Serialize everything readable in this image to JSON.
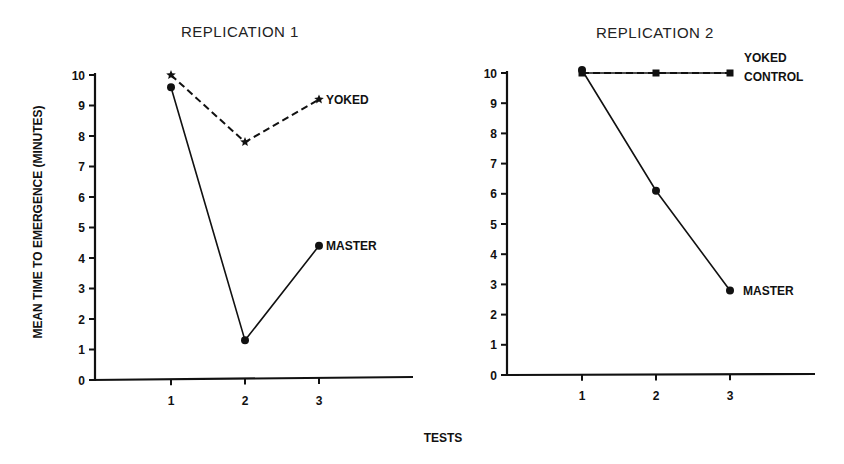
{
  "figure": {
    "shared_xlabel": "TESTS",
    "shared_ylabel": "MEAN TIME TO EMERGENCE (MINUTES)"
  },
  "chart_data": [
    {
      "type": "line",
      "title": "REPLICATION 1",
      "xlabel": "TESTS",
      "ylabel": "MEAN TIME TO EMERGENCE (MINUTES)",
      "x": [
        1,
        2,
        3
      ],
      "x_tick_labels": [
        "1",
        "2",
        "3"
      ],
      "y_ticks": [
        0,
        1,
        2,
        3,
        4,
        5,
        6,
        7,
        8,
        9,
        10
      ],
      "ylim": [
        0,
        10
      ],
      "grid": false,
      "legend": "inline labels at end of lines",
      "series": [
        {
          "name": "YOKED",
          "label": "YOKED",
          "style": "dashed",
          "marker": "star",
          "values": [
            10.0,
            7.8,
            9.2
          ]
        },
        {
          "name": "MASTER",
          "label": "MASTER",
          "style": "solid",
          "marker": "circle",
          "values": [
            9.6,
            1.3,
            4.4
          ]
        }
      ]
    },
    {
      "type": "line",
      "title": "REPLICATION 2",
      "xlabel": "TESTS",
      "ylabel": "MEAN TIME TO EMERGENCE (MINUTES)",
      "x": [
        1,
        2,
        3
      ],
      "x_tick_labels": [
        "1",
        "2",
        "3"
      ],
      "y_ticks": [
        0,
        1,
        2,
        3,
        4,
        5,
        6,
        7,
        8,
        9,
        10
      ],
      "ylim": [
        0,
        10
      ],
      "grid": false,
      "legend": "inline labels at end of lines",
      "series": [
        {
          "name": "YOKED CONTROL",
          "label_lines": [
            "YOKED",
            "CONTROL"
          ],
          "style": "dashed",
          "marker": "square",
          "values": [
            10.0,
            10.0,
            10.0
          ]
        },
        {
          "name": "MASTER",
          "label": "MASTER",
          "style": "solid",
          "marker": "circle",
          "values": [
            10.1,
            6.1,
            2.8
          ]
        }
      ]
    }
  ],
  "colors": {
    "ink": "#111111",
    "background": "#ffffff"
  }
}
